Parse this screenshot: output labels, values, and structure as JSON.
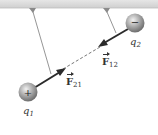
{
  "diagram": {
    "ceiling_color": "#d8d8d8",
    "string_color": "#8a8a8a",
    "arrow_color": "#2b2b2b",
    "sphere_color": "#9a9a9a",
    "charges": [
      {
        "id": "q1",
        "label_base": "q",
        "label_sub": "1",
        "sign": "+"
      },
      {
        "id": "q2",
        "label_base": "q",
        "label_sub": "2",
        "sign": "−"
      }
    ],
    "forces": [
      {
        "id": "F21",
        "label_base": "F",
        "label_sub": "21",
        "on": "q1",
        "direction": "toward q2"
      },
      {
        "id": "F12",
        "label_base": "F",
        "label_sub": "12",
        "on": "q2",
        "direction": "toward q1"
      }
    ]
  }
}
